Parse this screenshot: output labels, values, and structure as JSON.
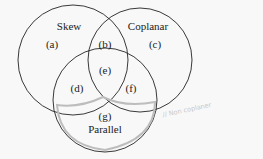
{
  "diagram": {
    "type": "venn",
    "sets": [
      {
        "name": "Skew",
        "label": "Skew"
      },
      {
        "name": "Coplanar",
        "label": "Coplanar"
      },
      {
        "name": "Parallel",
        "label": "Parallel"
      }
    ],
    "regions": {
      "a": "(a)",
      "b": "(b)",
      "c": "(c)",
      "d": "(d)",
      "e": "(e)",
      "f": "(f)",
      "g": "(g)"
    },
    "annotation": "// Non coplaner",
    "colors": {
      "stroke": "#222222",
      "highlight": "#bdbdbd",
      "background": "#f8f8f8"
    }
  }
}
